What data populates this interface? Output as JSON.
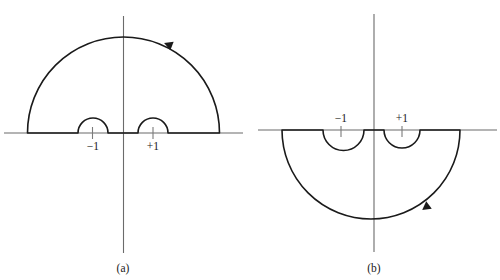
{
  "figure": {
    "background_color": "#ffffff",
    "line_color": "#1a1a1a",
    "axis_color": "#6b6b6b",
    "panels": [
      {
        "id": "a",
        "caption": "(a)",
        "caption_x": 123,
        "caption_y": 270,
        "origin_x": 123.5,
        "origin_y": 133,
        "axis_h_x1": 4,
        "axis_h_x2": 243,
        "axis_v_y1": 16,
        "axis_v_y2": 253,
        "big_radius": 96,
        "big_half": "upper",
        "big_left_x": 27.5,
        "big_right_x": 219.5,
        "big_apex_y": 37,
        "arrow_x": 172,
        "arrow_y": 46,
        "arrow_rotation": 200,
        "points": [
          {
            "label": "−1",
            "label_x": 93,
            "label_y": 150,
            "center_x": 92.5,
            "radius": 15,
            "tick_y1": 127,
            "tick_y2": 138
          },
          {
            "label": "+1",
            "label_x": 153,
            "label_y": 150,
            "center_x": 153,
            "radius": 15,
            "tick_y1": 127,
            "tick_y2": 138
          }
        ]
      },
      {
        "id": "b",
        "caption": "(b)",
        "caption_x": 374,
        "caption_y": 270,
        "origin_x": 374,
        "origin_y": 130,
        "axis_h_x1": 258,
        "axis_h_x2": 497,
        "axis_v_y1": 14,
        "axis_v_y2": 252,
        "big_radius": 88,
        "big_half": "lower",
        "big_left_x": 282,
        "big_right_x": 460,
        "big_apex_y": 219,
        "arrow_x": 429,
        "arrow_y": 205,
        "arrow_rotation": 56,
        "points": [
          {
            "label": "−1",
            "label_x": 341,
            "label_y": 124,
            "center_x": 341,
            "radius": 18,
            "tick_y1": 126,
            "tick_y2": 136
          },
          {
            "label": "+1",
            "label_x": 402,
            "label_y": 124,
            "center_x": 402,
            "radius": 18,
            "tick_y1": 126,
            "tick_y2": 136
          }
        ]
      }
    ]
  },
  "diagram_data": {
    "type": "contour-integration-diagram",
    "description": "Two complex-plane contour diagrams showing indented semicircular contours avoiding branch points at -1 and +1",
    "panel_a": {
      "caption": "(a)",
      "contour_half": "upper",
      "orientation": "counterclockwise",
      "branch_points": [
        "−1",
        "+1"
      ],
      "big_arc_radius_px": 96,
      "indentation_radius_px": 15,
      "indentation_direction": "upward"
    },
    "panel_b": {
      "caption": "(b)",
      "contour_half": "lower",
      "orientation": "clockwise",
      "branch_points": [
        "−1",
        "+1"
      ],
      "big_arc_radius_px": 88,
      "indentation_radius_px": 18,
      "indentation_direction": "downward"
    }
  }
}
